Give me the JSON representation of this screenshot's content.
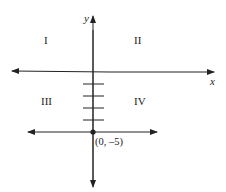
{
  "diagram": {
    "axis_labels": {
      "x": "x",
      "y": "y"
    },
    "quadrants": {
      "I": "I",
      "II": "II",
      "III": "III",
      "IV": "IV"
    },
    "point_label": "(0, –5)",
    "tick_count": 4,
    "colors": {
      "line": "#222222",
      "background": "#ffffff"
    }
  }
}
